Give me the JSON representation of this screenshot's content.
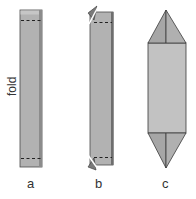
{
  "figure": {
    "panels": [
      {
        "id": "a",
        "label": "a",
        "annotation": "fold"
      },
      {
        "id": "b",
        "label": "b"
      },
      {
        "id": "c",
        "label": "c"
      }
    ],
    "colors": {
      "paper_face": "#b4b4b4",
      "paper_edge": "#8a8a8a",
      "paper_light": "#cfcfcf",
      "outline": "#3a3a3a",
      "fold_line": "#2a2a2a",
      "background": "#ffffff"
    }
  }
}
